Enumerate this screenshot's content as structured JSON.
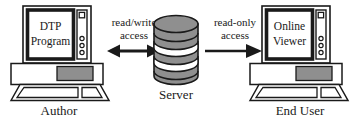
{
  "diagram": {
    "nodes": [
      {
        "id": "author-workstation",
        "screen_line1": "DTP",
        "screen_line2": "Program",
        "caption": "Author"
      },
      {
        "id": "server",
        "caption": "Server"
      },
      {
        "id": "end-user-workstation",
        "screen_line1": "Online",
        "screen_line2": "Viewer",
        "caption": "End User"
      }
    ],
    "edges": [
      {
        "id": "author-to-server",
        "label_line1": "read/write",
        "label_line2": "access",
        "direction": "bidirectional"
      },
      {
        "id": "server-to-end-user",
        "label_line1": "read-only",
        "label_line2": "access",
        "direction": "right"
      }
    ],
    "colors": {
      "stroke": "#1a1a1a",
      "fill_gray": "#8f8f8f",
      "fill_white": "#ffffff",
      "background": "#ffffff"
    }
  }
}
